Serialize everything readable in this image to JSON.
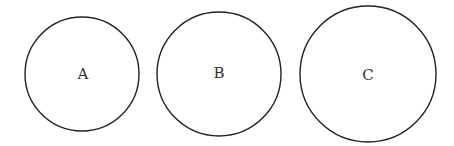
{
  "diagram": {
    "circles": [
      {
        "label": "A",
        "cx": 82,
        "cy": 74,
        "r": 57
      },
      {
        "label": "B",
        "cx": 219,
        "cy": 74,
        "r": 62
      },
      {
        "label": "C",
        "cx": 368,
        "cy": 74,
        "r": 68
      }
    ],
    "stroke_color": "#222222",
    "background": "#ffffff"
  }
}
